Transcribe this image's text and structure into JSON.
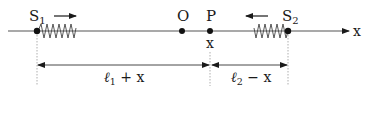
{
  "diagram": {
    "axis_label": "x",
    "points": {
      "s1": {
        "name": "S",
        "sub": "1"
      },
      "o": {
        "name": "O"
      },
      "p": {
        "name": "P",
        "coord": "x"
      },
      "s2": {
        "name": "S",
        "sub": "2"
      }
    },
    "motion": {
      "s1_direction": "right",
      "s2_direction": "left"
    },
    "dimensions": {
      "left": {
        "ell": "ℓ",
        "sub": "1",
        "rest": " + x"
      },
      "right": {
        "ell": "ℓ",
        "sub": "2",
        "rest": " − x"
      }
    },
    "colors": {
      "ink": "#1a1a1a",
      "line": "#555555",
      "guide": "#9a9a9a"
    }
  }
}
